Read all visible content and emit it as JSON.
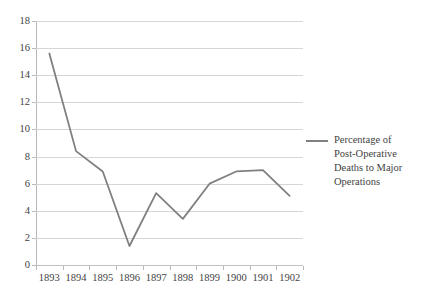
{
  "chart_data": {
    "type": "line",
    "title": "",
    "subtitle": "",
    "xlabel": "",
    "ylabel": "",
    "categories": [
      "1893",
      "1894",
      "1895",
      "1896",
      "1897",
      "1898",
      "1899",
      "1900",
      "1901",
      "1902"
    ],
    "series": [
      {
        "name": "Percentage of Post-Operative Deaths to Major Operations",
        "values": [
          15.6,
          8.4,
          6.9,
          1.4,
          5.3,
          3.4,
          6.0,
          6.9,
          7.0,
          5.1
        ],
        "color": "#808080"
      }
    ],
    "ylim": [
      0,
      18
    ],
    "y_ticks": [
      0,
      2,
      4,
      6,
      8,
      10,
      12,
      14,
      16,
      18
    ],
    "y_tick_labels": [
      "0",
      "2",
      "4",
      "6",
      "8",
      "10",
      "12",
      "14",
      "16",
      "18"
    ],
    "grid": true,
    "grid_axis": "y",
    "legend_position": "right",
    "legend_entries": [
      "Percentage of Post-Operative Deaths to Major Operations"
    ]
  },
  "legend": {
    "line1": "Percentage of",
    "line2": "Post-Operative",
    "line3": "Deaths to Major",
    "line4": "Operations"
  },
  "colors": {
    "line": "#808080",
    "grid": "#d6d6d6",
    "axis": "#b8b8b8",
    "text": "#3f3f3f",
    "background": "#ffffff"
  }
}
